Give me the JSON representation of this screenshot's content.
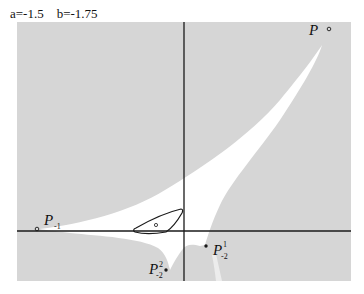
{
  "title": {
    "a_label": "a=-1.5",
    "b_label": "b=-1.75",
    "text": "a=-1.5    b=-1.75"
  },
  "colors": {
    "background": "#ffffff",
    "region_gray": "#d6d6d6",
    "basin_white": "#ffffff",
    "axis": "#1a1a1a",
    "curve": "#1a1a1a"
  },
  "points": {
    "P": {
      "label": "P",
      "marker": "open-circle"
    },
    "P_minus1": {
      "label": "P",
      "subscript": "-1",
      "marker": "open-circle"
    },
    "P_minus2_1": {
      "label": "P",
      "subscript": "-2",
      "superscript": "1",
      "marker": "filled-dot"
    },
    "P_minus2_2": {
      "label": "P",
      "subscript": "-2",
      "superscript": "2",
      "marker": "filled-dot"
    },
    "loop_center": {
      "marker": "open-circle"
    }
  }
}
